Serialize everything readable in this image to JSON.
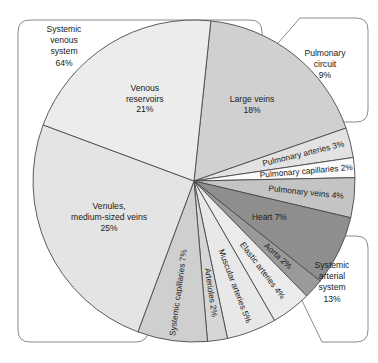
{
  "figure": {
    "center": {
      "x": 194,
      "y": 181
    },
    "radius": 161
  },
  "chart_data": {
    "type": "pie",
    "xlabel": "",
    "ylabel": "",
    "unit": "%",
    "total": 100,
    "start_angle_deg": -84,
    "direction": "clockwise",
    "legend_position": "callout-labels",
    "grid": false,
    "categories": [
      "Large veins",
      "Pulmonary arteries",
      "Pulmonary capillaries",
      "Pulmonary veins",
      "Heart",
      "Aorta",
      "Elastic arteries",
      "Muscular arteries",
      "Arterioles",
      "Systemic capillaries",
      "Venules, medium-sized veins",
      "Venous reservoirs"
    ],
    "values": [
      18,
      3,
      2,
      4,
      7,
      2,
      4,
      5,
      2,
      7,
      25,
      21
    ],
    "slices": [
      {
        "label": "Large veins",
        "value": 18,
        "text": "Large veins",
        "pct": "18%",
        "color": "#d0d0d0",
        "style": "horizontal"
      },
      {
        "label": "Pulmonary arteries",
        "value": 3,
        "text": "Pulmonary arteries 3%",
        "pct": "3%",
        "color": "#e2e2e2",
        "style": "radial"
      },
      {
        "label": "Pulmonary capillaries",
        "value": 2,
        "text": "Pulmonary capillaries 2%",
        "pct": "2%",
        "color": "#fbfbfb",
        "style": "radial"
      },
      {
        "label": "Pulmonary veins",
        "value": 4,
        "text": "Pulmonary veins 4%",
        "pct": "4%",
        "color": "#c4c4c4",
        "style": "radial"
      },
      {
        "label": "Heart",
        "value": 7,
        "text": "Heart 7%",
        "pct": "7%",
        "color": "#8e8e8e",
        "style": "horizontal-small"
      },
      {
        "label": "Aorta",
        "value": 2,
        "text": "Aorta 2%",
        "pct": "2%",
        "color": "#9a9a9a",
        "style": "radial"
      },
      {
        "label": "Elastic arteries",
        "value": 4,
        "text": "Elastic arteries 4%",
        "pct": "4%",
        "color": "#ebebeb",
        "style": "radial"
      },
      {
        "label": "Muscular arteries",
        "value": 5,
        "text": "Muscular arteries 5%",
        "pct": "5%",
        "color": "#e8e8e8",
        "style": "radial"
      },
      {
        "label": "Arterioles",
        "value": 2,
        "text": "Arterioles 2%",
        "pct": "2%",
        "color": "#d6d6d6",
        "style": "radial"
      },
      {
        "label": "Systemic capillaries",
        "value": 7,
        "text": "Systemic capillaries 7%",
        "pct": "7%",
        "color": "#cfcfcf",
        "style": "radial"
      },
      {
        "label": "Venules, medium-sized veins",
        "value": 25,
        "text": "Venules,|medium-sized veins",
        "pct": "25%",
        "color": "#e4e4e4",
        "style": "horizontal"
      },
      {
        "label": "Venous reservoirs",
        "value": 21,
        "text": "Venous|reservoirs",
        "pct": "21%",
        "color": "#ececec",
        "style": "horizontal"
      }
    ],
    "groups": [
      {
        "name": "Systemic venous system",
        "pct": "64%",
        "value": 64,
        "lines": [
          "Systemic",
          "venous",
          "system",
          "64%"
        ]
      },
      {
        "name": "Pulmonary circuit",
        "pct": "9%",
        "value": 9,
        "lines": [
          "Pulmonary",
          "circuit",
          "9%"
        ]
      },
      {
        "name": "Systemic arterial system",
        "pct": "13%",
        "value": 13,
        "lines": [
          "Systemic",
          "arterial",
          "system",
          "13%"
        ]
      }
    ]
  },
  "colors": {
    "outline": "#4a4a4a",
    "callout_border": "#8c8c8c",
    "text": "#1a1a1a",
    "background": "#ffffff"
  }
}
